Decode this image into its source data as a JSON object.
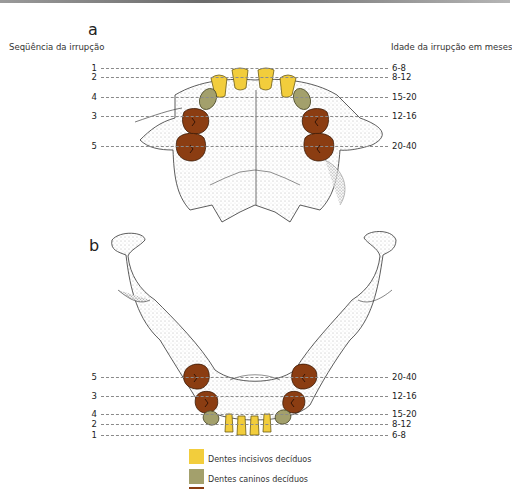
{
  "figure": {
    "panel_a_label": "a",
    "panel_b_label": "b",
    "header_left": "Seqüência da irrupção",
    "header_right": "Idade da irrupção em meses"
  },
  "colors": {
    "incisor": "#f2cd3c",
    "canine": "#a3a06c",
    "molar": "#8b3d12",
    "guide_line": "#8a8a8a"
  },
  "upper_jaw": {
    "rows": [
      {
        "sequence": "1",
        "age": "6-8"
      },
      {
        "sequence": "2",
        "age": "8-12"
      },
      {
        "sequence": "4",
        "age": "15-20"
      },
      {
        "sequence": "3",
        "age": "12-16"
      },
      {
        "sequence": "5",
        "age": "20-40"
      }
    ]
  },
  "lower_jaw": {
    "rows": [
      {
        "sequence": "5",
        "age": "20-40"
      },
      {
        "sequence": "3",
        "age": "12-16"
      },
      {
        "sequence": "4",
        "age": "15-20"
      },
      {
        "sequence": "2",
        "age": "8-12"
      },
      {
        "sequence": "1",
        "age": "6-8"
      }
    ]
  },
  "legend": [
    {
      "label": "Dentes incisivos decíduos",
      "color": "#f2cd3c"
    },
    {
      "label": "Dentes caninos decíduos",
      "color": "#a3a06c"
    },
    {
      "label": "Dentes molares decíduos",
      "color": "#8b3d12"
    }
  ]
}
